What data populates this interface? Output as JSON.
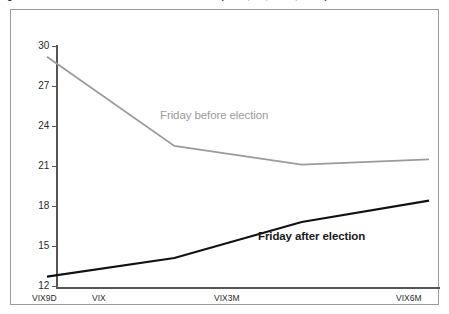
{
  "figure": {
    "caption": "Figure 1. VIX term structure around recent US elections (VIX9D, VIX, VIX3M, VIX6M)"
  },
  "chart_data": {
    "type": "line",
    "title": "",
    "xlabel": "",
    "ylabel": "",
    "categories": [
      "VIX9D",
      "VIX",
      "VIX3M",
      "VIX6M"
    ],
    "ylim": [
      12,
      30
    ],
    "yticks": [
      12,
      15,
      18,
      21,
      24,
      27,
      30
    ],
    "grid": false,
    "legend_position": "inline-annotation",
    "series": [
      {
        "name": "Friday before election",
        "color": "#9b9b9b",
        "values": [
          29.2,
          22.5,
          21.1,
          21.5
        ]
      },
      {
        "name": "Friday after election",
        "color": "#111111",
        "values": [
          12.7,
          14.1,
          16.8,
          18.4
        ]
      }
    ],
    "annotations": [
      {
        "text": "Friday before election",
        "series": "Friday before election"
      },
      {
        "text": "Friday after election",
        "series": "Friday after election"
      }
    ]
  },
  "axes": {
    "y_ticks": [
      {
        "label": "30"
      },
      {
        "label": "27"
      },
      {
        "label": "24"
      },
      {
        "label": "21"
      },
      {
        "label": "18"
      },
      {
        "label": "15"
      },
      {
        "label": "12"
      }
    ],
    "x_ticks": [
      {
        "label": "VIX9D"
      },
      {
        "label": "VIX"
      },
      {
        "label": "VIX3M"
      },
      {
        "label": "VIX6M"
      }
    ]
  },
  "colors": {
    "series_before": "#9b9b9b",
    "series_after": "#111111",
    "axis": "#555555",
    "frame": "#9a9a9a",
    "text": "#2b2b2b"
  }
}
